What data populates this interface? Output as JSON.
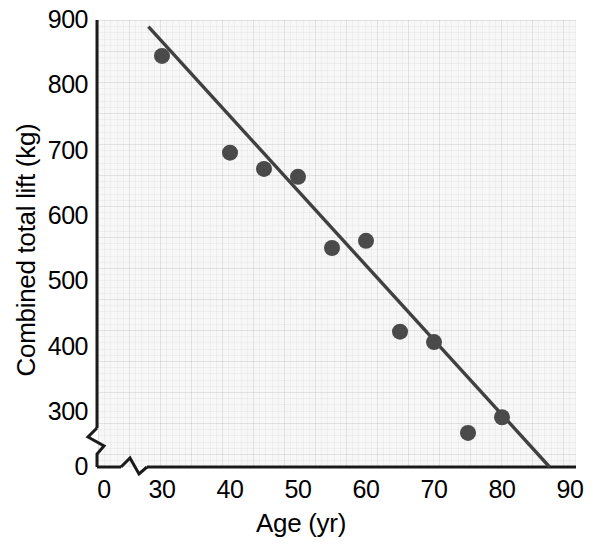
{
  "chart_data": {
    "type": "scatter",
    "title": "",
    "xlabel": "Age (yr)",
    "ylabel": "Combined total lift (kg)",
    "xlim": [
      0,
      90
    ],
    "ylim": [
      0,
      900
    ],
    "x_break": true,
    "y_break": true,
    "x_break_after": 0,
    "y_break_after": 0,
    "grid": true,
    "grid_style": "graph-paper",
    "legend": "none",
    "xticks": [
      "0",
      "30",
      "40",
      "50",
      "60",
      "70",
      "80",
      "90"
    ],
    "xtick_values": [
      0,
      30,
      40,
      50,
      60,
      70,
      80,
      90
    ],
    "yticks": [
      "0",
      "300",
      "400",
      "500",
      "600",
      "700",
      "800",
      "900"
    ],
    "ytick_values": [
      0,
      300,
      400,
      500,
      600,
      700,
      800,
      900
    ],
    "points": [
      {
        "x": 30,
        "y": 845
      },
      {
        "x": 40,
        "y": 697
      },
      {
        "x": 45,
        "y": 672
      },
      {
        "x": 50,
        "y": 660
      },
      {
        "x": 55,
        "y": 551
      },
      {
        "x": 60,
        "y": 562
      },
      {
        "x": 65,
        "y": 423
      },
      {
        "x": 70,
        "y": 407
      },
      {
        "x": 75,
        "y": 268
      },
      {
        "x": 80,
        "y": 292
      }
    ],
    "trendline": {
      "type": "linear-fit",
      "x_start": 28,
      "y_start": 890,
      "x_end": 87,
      "y_end": 0
    },
    "colors": {
      "point": "#4a4a4a",
      "line": "#404040",
      "axis": "#1a1a1a",
      "plot_background": "#f7f7f7",
      "page_background": "#ffffff",
      "text": "#000000"
    },
    "marker": {
      "shape": "circle",
      "radius": 8
    }
  }
}
